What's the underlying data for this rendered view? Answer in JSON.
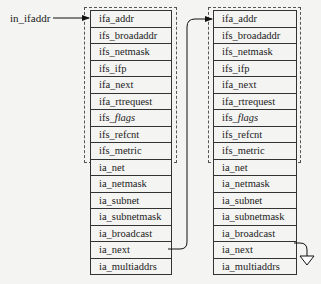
{
  "pointer_label": "in_ifaddr",
  "structures": [
    {
      "id": "ifaddr-1",
      "rows": [
        {
          "prefix": "ifa_addr",
          "italic": ""
        },
        {
          "prefix": "ifs_broadaddr",
          "italic": ""
        },
        {
          "prefix": "ifs_netmask",
          "italic": ""
        },
        {
          "prefix": "ifs_ifp",
          "italic": ""
        },
        {
          "prefix": "ifa_next",
          "italic": ""
        },
        {
          "prefix": "ifa_rtrequest",
          "italic": ""
        },
        {
          "prefix": "ifs_",
          "italic": "flags"
        },
        {
          "prefix": "ifs_refcnt",
          "italic": ""
        },
        {
          "prefix": "ifs_metric",
          "italic": ""
        },
        {
          "prefix": "ia_net",
          "italic": ""
        },
        {
          "prefix": "ia_netmask",
          "italic": ""
        },
        {
          "prefix": "ia_subnet",
          "italic": ""
        },
        {
          "prefix": "ia_subnetmask",
          "italic": ""
        },
        {
          "prefix": "ia_broadcast",
          "italic": ""
        },
        {
          "prefix": "ia_next",
          "italic": ""
        },
        {
          "prefix": "ia_multiaddrs",
          "italic": ""
        }
      ],
      "dashed_group_rows": 9
    },
    {
      "id": "ifaddr-2",
      "rows": [
        {
          "prefix": "ifa_addr",
          "italic": ""
        },
        {
          "prefix": "ifs_broadaddr",
          "italic": ""
        },
        {
          "prefix": "ifs_netmask",
          "italic": ""
        },
        {
          "prefix": "ifs_ifp",
          "italic": ""
        },
        {
          "prefix": "ifa_next",
          "italic": ""
        },
        {
          "prefix": "ifa_rtrequest",
          "italic": ""
        },
        {
          "prefix": "ifs_",
          "italic": "flags"
        },
        {
          "prefix": "ifs_refcnt",
          "italic": ""
        },
        {
          "prefix": "ifs_metric",
          "italic": ""
        },
        {
          "prefix": "ia_net",
          "italic": ""
        },
        {
          "prefix": "ia_netmask",
          "italic": ""
        },
        {
          "prefix": "ia_subnet",
          "italic": ""
        },
        {
          "prefix": "ia_subnetmask",
          "italic": ""
        },
        {
          "prefix": "ia_broadcast",
          "italic": ""
        },
        {
          "prefix": "ia_next",
          "italic": ""
        },
        {
          "prefix": "ia_multiaddrs",
          "italic": ""
        }
      ],
      "dashed_group_rows": 9
    }
  ],
  "links": [
    {
      "from": "in_ifaddr",
      "to": "ifaddr-1.ifa_addr"
    },
    {
      "from": "ifaddr-1.ia_next",
      "to": "ifaddr-2.ifa_addr"
    },
    {
      "from": "ifaddr-2.ia_next",
      "to": "null-ground-symbol"
    }
  ]
}
